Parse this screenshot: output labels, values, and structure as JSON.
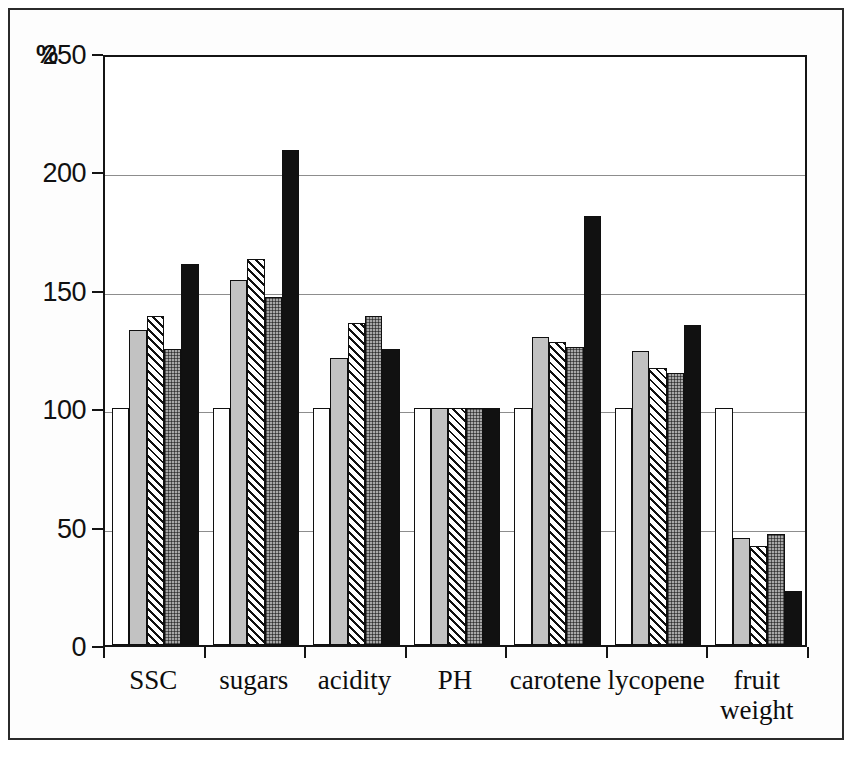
{
  "chart_data": {
    "type": "bar",
    "title": "",
    "subtitle": "",
    "xlabel": "",
    "ylabel": "%",
    "ylim": [
      0,
      250
    ],
    "yticks": [
      0,
      50,
      100,
      150,
      200,
      250
    ],
    "ytick_labels": [
      "0",
      "50",
      "100",
      "150",
      "200",
      "250"
    ],
    "grid": true,
    "legend": "none",
    "categories": [
      "SSC",
      "sugars",
      "acidity",
      "PH",
      "carotene",
      "lycopene",
      "fruit weight"
    ],
    "category_lines": [
      [
        "SSC"
      ],
      [
        "sugars"
      ],
      [
        "acidity"
      ],
      [
        "PH"
      ],
      [
        "carotene"
      ],
      [
        "lycopene"
      ],
      [
        "fruit",
        "weight"
      ]
    ],
    "series": [
      {
        "name": "series-1",
        "fill": "white",
        "values": [
          100,
          100,
          100,
          100,
          100,
          100,
          100
        ]
      },
      {
        "name": "series-2",
        "fill": "light-gray",
        "values": [
          133,
          154,
          121,
          100,
          130,
          124,
          45
        ]
      },
      {
        "name": "series-3",
        "fill": "hatched",
        "values": [
          139,
          163,
          136,
          100,
          128,
          117,
          42
        ]
      },
      {
        "name": "series-4",
        "fill": "dotted-gray",
        "values": [
          125,
          147,
          139,
          100,
          126,
          115,
          47
        ]
      },
      {
        "name": "series-5",
        "fill": "black",
        "values": [
          161,
          209,
          125,
          100,
          181,
          135,
          23
        ]
      }
    ],
    "colors": {
      "series_1": "#ffffff",
      "series_2": "#c2c2c2",
      "series_3": "#ffffff",
      "series_4": "#a8a8a8",
      "series_5": "#111111",
      "axis": "#141414",
      "grid": "#8d8d8d",
      "text": "#0d0d0d",
      "background": "#ffffff"
    }
  }
}
